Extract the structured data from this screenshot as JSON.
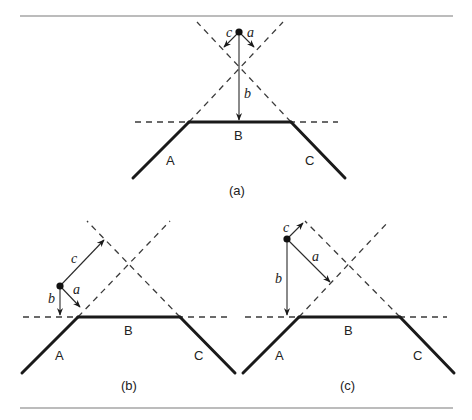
{
  "figure": {
    "panels": [
      {
        "id": "a",
        "caption": "(a)",
        "segments": {
          "left": "A",
          "middle": "B",
          "right": "C"
        },
        "vectors": {
          "a": "a",
          "b": "b",
          "c": "c"
        }
      },
      {
        "id": "b",
        "caption": "(b)",
        "segments": {
          "left": "A",
          "middle": "B",
          "right": "C"
        },
        "vectors": {
          "a": "a",
          "b": "b",
          "c": "c"
        }
      },
      {
        "id": "c",
        "caption": "(c)",
        "segments": {
          "left": "A",
          "middle": "B",
          "right": "C"
        },
        "vectors": {
          "a": "a",
          "b": "b",
          "c": "c"
        }
      }
    ]
  }
}
